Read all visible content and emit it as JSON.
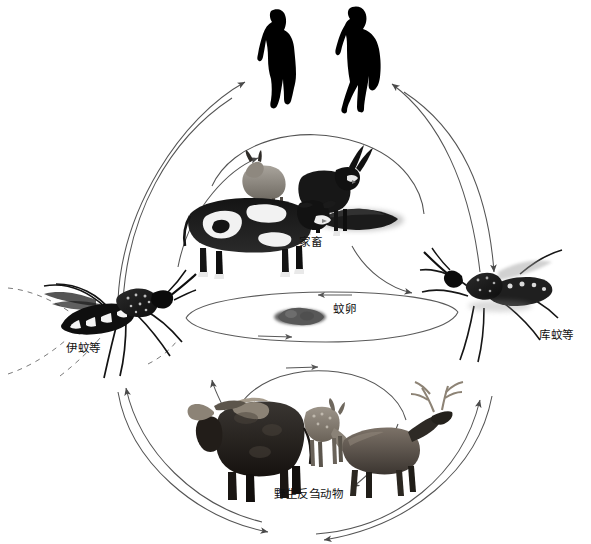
{
  "diagram": {
    "background_color": "#ffffff",
    "stroke_color": "#4a4a4a",
    "text_color": "#111111",
    "width": 591,
    "height": 544
  },
  "nodes": {
    "humans": {
      "label": "",
      "icon": "two-human-silhouettes",
      "count": 2,
      "color": "#000000",
      "position": "top-center"
    },
    "livestock": {
      "label": "家畜",
      "icon": "livestock-group",
      "animals": [
        "sheep",
        "goat",
        "cow",
        "resting-animal"
      ],
      "position": "upper-center"
    },
    "eggs": {
      "label": "蚊卵",
      "icon": "mosquito-egg-raft",
      "position": "center"
    },
    "aedes": {
      "label": "伊蚊等",
      "icon": "aedes-mosquito",
      "position": "left"
    },
    "culex": {
      "label": "库蚊等",
      "icon": "culex-mosquito",
      "position": "right"
    },
    "wild_ruminants": {
      "label": "野生反刍动物",
      "icon": "wild-ruminant-group",
      "animals": [
        "buffalo",
        "deer",
        "elk"
      ],
      "position": "bottom-center"
    }
  },
  "connections": [
    {
      "from": "aedes",
      "to": "humans",
      "style": "curved-arrow"
    },
    {
      "from": "humans",
      "to": "aedes",
      "style": "curved-arrow"
    },
    {
      "from": "culex",
      "to": "humans",
      "style": "curved-arrow"
    },
    {
      "from": "humans",
      "to": "culex",
      "style": "curved-arrow"
    },
    {
      "from": "aedes",
      "to": "livestock",
      "style": "curved-arrow"
    },
    {
      "from": "livestock",
      "to": "culex",
      "style": "curved-arrow"
    },
    {
      "from": "aedes",
      "to": "eggs",
      "style": "ellipse-arrow"
    },
    {
      "from": "eggs",
      "to": "culex",
      "style": "ellipse-arrow"
    },
    {
      "from": "aedes",
      "to": "wild_ruminants",
      "style": "curved-arrow"
    },
    {
      "from": "wild_ruminants",
      "to": "culex",
      "style": "curved-arrow"
    },
    {
      "from": "wild_ruminants",
      "to": "aedes",
      "style": "curved-arrow"
    },
    {
      "from": "culex",
      "to": "wild_ruminants",
      "style": "curved-arrow"
    }
  ]
}
